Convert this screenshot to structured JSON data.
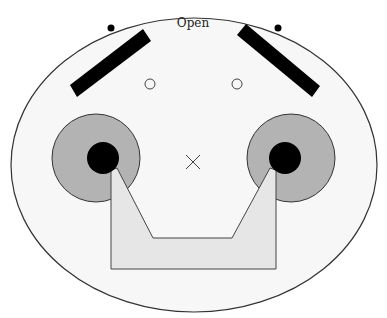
{
  "diagram": {
    "title": "Open",
    "colors": {
      "background": "#ffffff",
      "face_fill": "#f7f7f7",
      "outline": "#333333",
      "ear_fill": "#b3b3b3",
      "tray_fill": "#e6e6e6",
      "solid": "#000000"
    },
    "shapes": {
      "outer_ellipse": {
        "cx": 194,
        "cy": 165,
        "rx": 183,
        "ry": 147
      },
      "top_dots": [
        {
          "cx": 111,
          "cy": 28,
          "r": 3.5
        },
        {
          "cx": 278,
          "cy": 28,
          "r": 3.5
        }
      ],
      "bars": [
        "70,85 77,97 151,41 143,29",
        "237,35 246,24 320,86 312,97"
      ],
      "small_circles": [
        {
          "cx": 150,
          "cy": 84,
          "r": 5
        },
        {
          "cx": 237,
          "cy": 84,
          "r": 5
        }
      ],
      "ears": [
        {
          "cx": 96,
          "cy": 158,
          "r": 44
        },
        {
          "cx": 291,
          "cy": 158,
          "r": 44
        }
      ],
      "ear_cores": [
        {
          "cx": 103,
          "cy": 158,
          "r": 16
        },
        {
          "cx": 285,
          "cy": 158,
          "r": 16
        }
      ],
      "tray": "111,170 111,269 276,269 276,170 270,168 232,238 153,238 117,168",
      "center_mark": {
        "cx": 193,
        "cy": 162,
        "size": 7
      }
    }
  }
}
